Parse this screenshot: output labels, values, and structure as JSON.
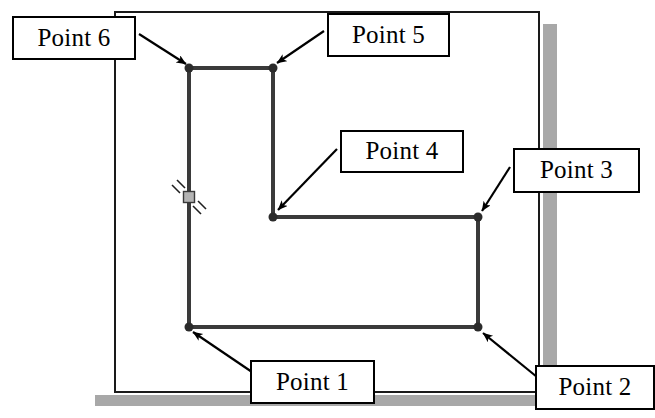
{
  "figure": {
    "type": "cad-polyline-callout-diagram",
    "colors": {
      "background": "#ffffff",
      "window_border": "#1a1a1a",
      "window_shadow": "#a8a8a8",
      "polyline": "#3a3a3a",
      "vertex_dot": "#2b2b2b",
      "grip_square_fill": "#b4b4b4",
      "grip_square_border": "#3a3a3a",
      "callout_border": "#000000",
      "callout_fill": "#ffffff",
      "leader_line": "#000000",
      "text": "#000000"
    }
  },
  "window": {
    "name": "drawing-window",
    "x": 115,
    "y": 12,
    "width": 424,
    "height": 380,
    "border_width": 2,
    "shadow_offset": 4,
    "shadow_thickness": 14
  },
  "polyline": {
    "name": "l-shaped-polyline",
    "stroke_width": 4,
    "closed": true,
    "vertices": [
      {
        "id": "p1",
        "label": "Point 1",
        "x": 189,
        "y": 327
      },
      {
        "id": "p2",
        "label": "Point 2",
        "x": 478,
        "y": 327
      },
      {
        "id": "p3",
        "label": "Point 3",
        "x": 478,
        "y": 217
      },
      {
        "id": "p4",
        "label": "Point 4",
        "x": 273,
        "y": 217
      },
      {
        "id": "p5",
        "label": "Point 5",
        "x": 273,
        "y": 68
      },
      {
        "id": "p6",
        "label": "Point 6",
        "x": 189,
        "y": 68
      }
    ],
    "vertex_dot_radius": 4.5
  },
  "grip": {
    "name": "midpoint-grip",
    "x": 189,
    "y": 197,
    "size": 11,
    "tick_count": 2
  },
  "callouts": [
    {
      "id": "callout-point-6",
      "label": "Point 6",
      "x": 12,
      "y": 16,
      "width": 124,
      "height": 44,
      "leader": {
        "from_x": 139,
        "from_y": 34,
        "to_x": 186,
        "to_y": 64
      }
    },
    {
      "id": "callout-point-5",
      "label": "Point 5",
      "x": 327,
      "y": 13,
      "width": 123,
      "height": 44,
      "leader": {
        "from_x": 324,
        "from_y": 31,
        "to_x": 277,
        "to_y": 63
      }
    },
    {
      "id": "callout-point-4",
      "label": "Point 4",
      "x": 340,
      "y": 130,
      "width": 124,
      "height": 43,
      "leader": {
        "from_x": 337,
        "from_y": 149,
        "to_x": 278,
        "to_y": 210
      }
    },
    {
      "id": "callout-point-3",
      "label": "Point 3",
      "x": 513,
      "y": 148,
      "width": 127,
      "height": 45,
      "leader": {
        "from_x": 510,
        "from_y": 167,
        "to_x": 482,
        "to_y": 211
      }
    },
    {
      "id": "callout-point-1",
      "label": "Point 1",
      "x": 250,
      "y": 360,
      "width": 125,
      "height": 44,
      "leader": {
        "from_x": 252,
        "from_y": 372,
        "to_x": 193,
        "to_y": 332
      }
    },
    {
      "id": "callout-point-2",
      "label": "Point 2",
      "x": 535,
      "y": 365,
      "width": 120,
      "height": 45,
      "leader": {
        "from_x": 537,
        "from_y": 377,
        "to_x": 483,
        "to_y": 333
      }
    }
  ]
}
